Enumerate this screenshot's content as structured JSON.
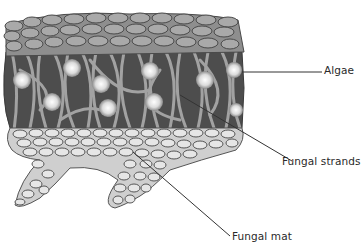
{
  "diagram": {
    "labels": [
      {
        "id": "algae",
        "text": "Algae"
      },
      {
        "id": "fungal-strands",
        "text": "Fungal strands"
      },
      {
        "id": "fungal-mat",
        "text": "Fungal mat"
      }
    ],
    "layers": [
      "upper cortex",
      "algal layer with fungal strands",
      "lower fungal mat"
    ],
    "colors": {
      "upper_cells": "#a9a9a9",
      "upper_cell_outline": "#4a4a4a",
      "middle_bg": "#4d4d4d",
      "strands": "#9a9a9a",
      "algae": "#e8e8e8",
      "lower_cells": "#e6e6e6",
      "lower_cell_outline": "#555555",
      "leader": "#333333",
      "text": "#2a2a2a"
    }
  }
}
